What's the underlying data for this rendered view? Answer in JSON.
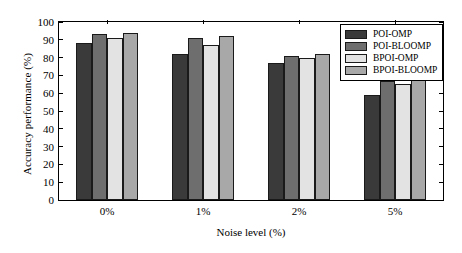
{
  "chart_data": {
    "type": "bar",
    "title": "",
    "xlabel": "Noise level (%)",
    "ylabel": "Accuracy performance (%)",
    "categories": [
      "0%",
      "1%",
      "2%",
      "5%"
    ],
    "ylim": [
      0,
      100
    ],
    "yticks": [
      0,
      10,
      20,
      30,
      40,
      50,
      60,
      70,
      80,
      90,
      100
    ],
    "ytick_labels": [
      "0",
      "10",
      "20",
      "30",
      "40",
      "50",
      "60",
      "70",
      "80",
      "90",
      "100"
    ],
    "grid": false,
    "legend_position": "top-right",
    "series": [
      {
        "name": "POI-OMP",
        "color": "#3a3a3a",
        "values": [
          88,
          82,
          77,
          59
        ]
      },
      {
        "name": "POI-BLOOMP",
        "color": "#6e6e6e",
        "values": [
          93,
          91,
          81,
          67
        ]
      },
      {
        "name": "BPOI-OMP",
        "color": "#e3e3e3",
        "values": [
          91,
          87,
          80,
          65
        ]
      },
      {
        "name": "BPOI-BLOOMP",
        "color": "#a8a8a8",
        "values": [
          94,
          92,
          82,
          69
        ]
      }
    ]
  }
}
